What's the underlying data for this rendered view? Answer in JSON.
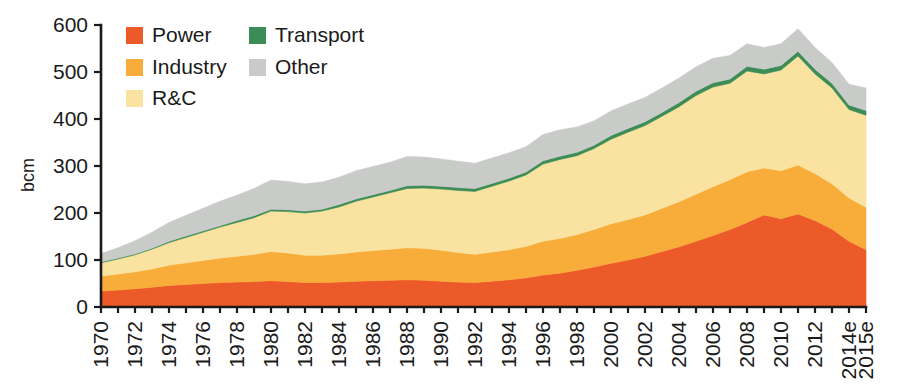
{
  "chart_data": {
    "type": "area",
    "stacked": true,
    "title": "",
    "xlabel": "",
    "ylabel": "bcm",
    "ylim": [
      0,
      600
    ],
    "yticks": [
      0,
      100,
      200,
      300,
      400,
      500,
      600
    ],
    "grid": false,
    "legend_position": "top-left-inside",
    "x": [
      "1970",
      "1971",
      "1972",
      "1973",
      "1974",
      "1975",
      "1976",
      "1977",
      "1978",
      "1979",
      "1980",
      "1981",
      "1982",
      "1983",
      "1984",
      "1985",
      "1986",
      "1987",
      "1988",
      "1989",
      "1990",
      "1991",
      "1992",
      "1993",
      "1994",
      "1995",
      "1996",
      "1997",
      "1998",
      "1999",
      "2000",
      "2001",
      "2002",
      "2003",
      "2004",
      "2005",
      "2006",
      "2007",
      "2008",
      "2009",
      "2010",
      "2011",
      "2012",
      "2013",
      "2014e",
      "2015e"
    ],
    "xtick_labels": [
      "1970",
      "",
      "1972",
      "",
      "1974",
      "",
      "1976",
      "",
      "1978",
      "",
      "1980",
      "",
      "1982",
      "",
      "1984",
      "",
      "1986",
      "",
      "1988",
      "",
      "1990",
      "",
      "1992",
      "",
      "1994",
      "",
      "1996",
      "",
      "1998",
      "",
      "2000",
      "",
      "2002",
      "",
      "2004",
      "",
      "2006",
      "",
      "2008",
      "",
      "2010",
      "",
      "2012",
      "",
      "2014e",
      "2015e"
    ],
    "series": [
      {
        "name": "Power",
        "color": "#ED5A29",
        "values": [
          34,
          36,
          39,
          42,
          46,
          48,
          50,
          52,
          53,
          54,
          56,
          54,
          52,
          52,
          53,
          55,
          56,
          57,
          58,
          57,
          55,
          53,
          52,
          55,
          58,
          62,
          68,
          72,
          78,
          85,
          93,
          100,
          108,
          118,
          128,
          140,
          152,
          165,
          180,
          196,
          188,
          198,
          184,
          166,
          140,
          122
        ]
      },
      {
        "name": "Industry",
        "color": "#F8AD3B",
        "values": [
          32,
          34,
          36,
          39,
          43,
          46,
          49,
          52,
          55,
          58,
          62,
          61,
          58,
          58,
          60,
          62,
          64,
          66,
          68,
          68,
          66,
          63,
          60,
          62,
          64,
          67,
          72,
          74,
          76,
          80,
          84,
          86,
          88,
          92,
          96,
          100,
          104,
          106,
          108,
          100,
          102,
          104,
          100,
          96,
          92,
          90
        ]
      },
      {
        "name": "R&C",
        "color": "#FAE2A0",
        "values": [
          28,
          32,
          36,
          42,
          48,
          54,
          60,
          66,
          72,
          78,
          86,
          88,
          90,
          94,
          100,
          108,
          114,
          120,
          126,
          128,
          130,
          132,
          134,
          140,
          146,
          152,
          164,
          168,
          168,
          172,
          180,
          186,
          190,
          196,
          202,
          210,
          212,
          205,
          214,
          200,
          214,
          232,
          212,
          204,
          188,
          196
        ]
      },
      {
        "name": "Transport",
        "color": "#3C8C55",
        "values": [
          2,
          2,
          2,
          2,
          3,
          3,
          3,
          3,
          4,
          4,
          4,
          4,
          4,
          4,
          5,
          5,
          5,
          5,
          6,
          6,
          6,
          6,
          6,
          6,
          6,
          6,
          7,
          7,
          7,
          7,
          8,
          8,
          8,
          8,
          9,
          9,
          9,
          9,
          10,
          10,
          10,
          10,
          10,
          10,
          10,
          10
        ]
      },
      {
        "name": "Other",
        "color": "#C9CBC9",
        "values": [
          18,
          22,
          28,
          34,
          40,
          44,
          48,
          52,
          54,
          58,
          62,
          60,
          58,
          58,
          58,
          60,
          60,
          60,
          62,
          60,
          58,
          56,
          54,
          54,
          54,
          54,
          56,
          56,
          54,
          52,
          52,
          52,
          52,
          52,
          52,
          52,
          52,
          50,
          48,
          46,
          46,
          48,
          46,
          44,
          44,
          48
        ]
      }
    ],
    "totals": [
      114,
      126,
      141,
      159,
      180,
      195,
      210,
      225,
      238,
      252,
      270,
      267,
      262,
      266,
      276,
      290,
      299,
      308,
      320,
      319,
      315,
      310,
      306,
      317,
      328,
      341,
      367,
      377,
      383,
      396,
      417,
      432,
      446,
      466,
      487,
      511,
      529,
      535,
      560,
      552,
      560,
      592,
      552,
      520,
      474,
      466
    ]
  },
  "legend": {
    "items": [
      {
        "label": "Power",
        "color": "#ED5A29"
      },
      {
        "label": "Industry",
        "color": "#F8AD3B"
      },
      {
        "label": "R&C",
        "color": "#FAE2A0"
      },
      {
        "label": "Transport",
        "color": "#3C8C55"
      },
      {
        "label": "Other",
        "color": "#C9CBC9"
      }
    ]
  },
  "axes": {
    "y_title": "bcm",
    "y_tick_labels": [
      "0",
      "100",
      "200",
      "300",
      "400",
      "500",
      "600"
    ],
    "x_tick_labels": [
      "1970",
      "1972",
      "1974",
      "1976",
      "1978",
      "1980",
      "1982",
      "1984",
      "1986",
      "1988",
      "1990",
      "1992",
      "1994",
      "1996",
      "1998",
      "2000",
      "2002",
      "2004",
      "2006",
      "2008",
      "2010",
      "2012",
      "2014e",
      "2015e"
    ]
  }
}
